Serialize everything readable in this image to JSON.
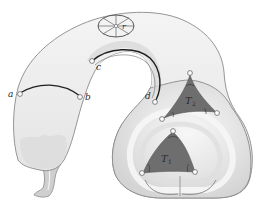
{
  "figure": {
    "colors": {
      "surface_fill": "#ececec",
      "surface_band": "#d9d9d9",
      "surface_outline": "#8a8a8a",
      "triangle_fill": "#6e6e6e",
      "curve": "#1e1e1e",
      "point_fill": "#ffffff"
    },
    "points": [
      {
        "id": "a",
        "label": "a"
      },
      {
        "id": "b",
        "label": "b"
      },
      {
        "id": "c",
        "label": "c"
      },
      {
        "id": "d",
        "label": "d"
      }
    ],
    "disk": {
      "label": "r"
    },
    "triangles": [
      {
        "id": "T2",
        "label": "T",
        "subscript": "2"
      },
      {
        "id": "T1",
        "label": "T",
        "subscript": "1"
      }
    ],
    "segments": [
      {
        "from": "a",
        "to": "b"
      },
      {
        "from": "c",
        "to": "d"
      }
    ]
  }
}
